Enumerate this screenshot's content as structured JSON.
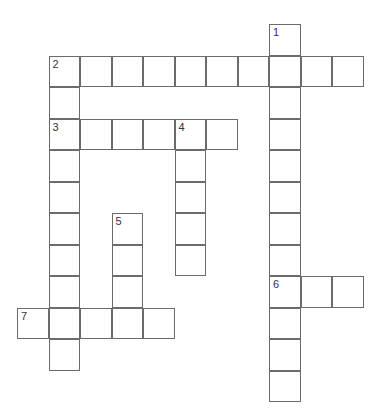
{
  "puzzle": {
    "type": "crossword",
    "cell_size": 31.5,
    "origin": {
      "x": 17,
      "y": 24
    },
    "colors": {
      "border": "#6b6b6b",
      "cell": "#ffffff",
      "number": "#333333"
    },
    "clue_numbers": [
      "1",
      "2",
      "3",
      "4",
      "5",
      "6",
      "7"
    ],
    "entries": [
      {
        "number": "1",
        "direction": "down",
        "row": 0,
        "col": 8,
        "length": 12
      },
      {
        "number": "2",
        "direction": "across",
        "row": 1,
        "col": 1,
        "length": 10
      },
      {
        "number": "2",
        "direction": "down",
        "row": 1,
        "col": 1,
        "length": 10
      },
      {
        "number": "3",
        "direction": "across",
        "row": 3,
        "col": 1,
        "length": 6
      },
      {
        "number": "4",
        "direction": "down",
        "row": 3,
        "col": 5,
        "length": 5
      },
      {
        "number": "5",
        "direction": "down",
        "row": 6,
        "col": 3,
        "length": 4
      },
      {
        "number": "6",
        "direction": "across",
        "row": 8,
        "col": 8,
        "length": 3
      },
      {
        "number": "7",
        "direction": "across",
        "row": 9,
        "col": 0,
        "length": 5
      }
    ]
  }
}
